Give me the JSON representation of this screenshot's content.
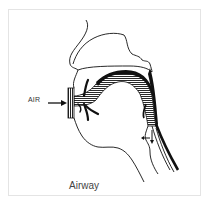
{
  "figure": {
    "caption": "Airway",
    "labels": {
      "air": "AIR"
    },
    "colors": {
      "line": "#111111",
      "frame": "#e4e4e4",
      "background": "#ffffff",
      "text": "#444444"
    },
    "elements": [
      "head-profile-outline",
      "nasal-cavity-outline",
      "mouthpiece",
      "airway-passage-hatched",
      "tongue",
      "trachea",
      "esophagus",
      "air-arrow",
      "epiglottis-arrows"
    ]
  }
}
